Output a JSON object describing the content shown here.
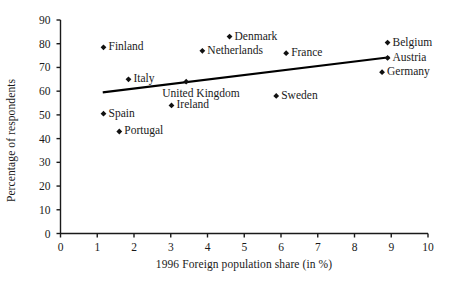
{
  "chart_data": {
    "type": "scatter",
    "title": "",
    "xlabel": "1996 Foreign population share (in %)",
    "ylabel": "Percentage of respondents",
    "xlim": [
      0,
      10
    ],
    "ylim": [
      0,
      90
    ],
    "xticks": [
      "0",
      "1",
      "2",
      "3",
      "4",
      "5",
      "6",
      "7",
      "8",
      "9",
      "10"
    ],
    "yticks": [
      "0",
      "10",
      "20",
      "30",
      "40",
      "50",
      "60",
      "70",
      "80",
      "90"
    ],
    "grid": false,
    "legend": "none",
    "marker": "diamond",
    "marker_color": "#111111",
    "line_color": "#000000",
    "points": [
      {
        "label": "Finland",
        "x": 1.17,
        "y": 78.5,
        "label_side": "right"
      },
      {
        "label": "Denmark",
        "x": 4.6,
        "y": 83.0,
        "label_side": "right"
      },
      {
        "label": "Belgium",
        "x": 8.9,
        "y": 80.5,
        "label_side": "right"
      },
      {
        "label": "Netherlands",
        "x": 3.86,
        "y": 77.0,
        "label_side": "right"
      },
      {
        "label": "France",
        "x": 6.14,
        "y": 76.0,
        "label_side": "right"
      },
      {
        "label": "Austria",
        "x": 8.9,
        "y": 74.0,
        "label_side": "right"
      },
      {
        "label": "Germany",
        "x": 8.75,
        "y": 68.0,
        "label_side": "right"
      },
      {
        "label": "Italy",
        "x": 1.85,
        "y": 65.0,
        "label_side": "right"
      },
      {
        "label": "United Kingdom",
        "x": 3.42,
        "y": 64.0,
        "label_side": "below"
      },
      {
        "label": "Sweden",
        "x": 5.87,
        "y": 58.0,
        "label_side": "right"
      },
      {
        "label": "Ireland",
        "x": 3.02,
        "y": 54.0,
        "label_side": "right"
      },
      {
        "label": "Spain",
        "x": 1.17,
        "y": 50.5,
        "label_side": "right"
      },
      {
        "label": "Portugal",
        "x": 1.6,
        "y": 43.0,
        "label_side": "right"
      }
    ],
    "trendline": {
      "name": "linear fit",
      "x_start": 1.15,
      "y_start": 59.5,
      "x_end": 8.95,
      "y_end": 74.3
    }
  }
}
